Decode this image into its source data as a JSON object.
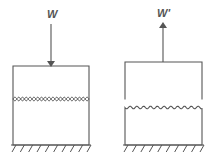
{
  "diagram": {
    "colors": {
      "stroke": "#555555",
      "background": "#ffffff"
    },
    "panels": [
      {
        "id": "compressed",
        "load_label": "W",
        "load_direction": "down",
        "interface": "interlocked"
      },
      {
        "id": "separated",
        "load_label": "W'",
        "load_direction": "up",
        "interface": "separated"
      }
    ]
  }
}
